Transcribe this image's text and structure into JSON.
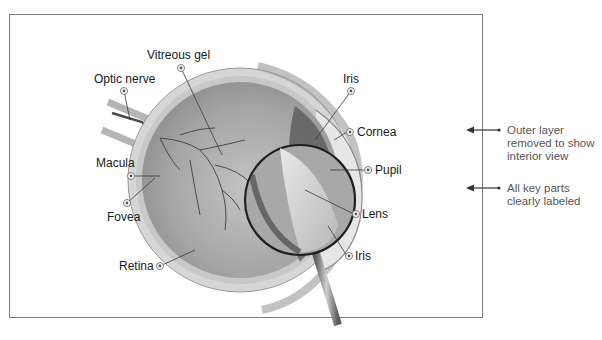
{
  "diagram": {
    "labels": {
      "vitreous_gel": "Vitreous gel",
      "optic_nerve": "Optic nerve",
      "macula": "Macula",
      "fovea": "Fovea",
      "retina": "Retina",
      "iris_top": "Iris",
      "cornea": "Cornea",
      "pupil": "Pupil",
      "lens": "Lens",
      "iris_bottom": "Iris"
    },
    "annotations": [
      {
        "line1": "Outer layer",
        "line2": "removed to show",
        "line3": "interior view"
      },
      {
        "line1": "All key parts",
        "line2": "clearly labeled"
      }
    ],
    "colors": {
      "frame_border": "#7d7d7d",
      "eye_fill": "#9a9a9a",
      "sclera": "#d9d9d9",
      "label_text": "#1a1a1a",
      "annotation_text": "#555555"
    }
  }
}
